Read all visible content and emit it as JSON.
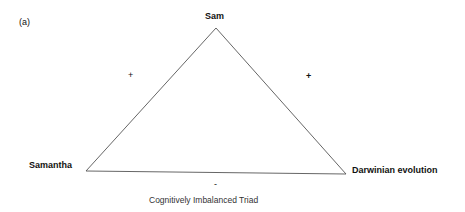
{
  "figure": {
    "panel_label": "(a)",
    "caption": "Cognitively Imbalanced Triad",
    "nodes": {
      "top": "Sam",
      "left": "Samantha",
      "right": "Darwinian evolution"
    },
    "edges": {
      "left_edge_sign": "+",
      "right_edge_sign": "+",
      "bottom_edge_sign": "-"
    },
    "line_color": "#555555"
  }
}
